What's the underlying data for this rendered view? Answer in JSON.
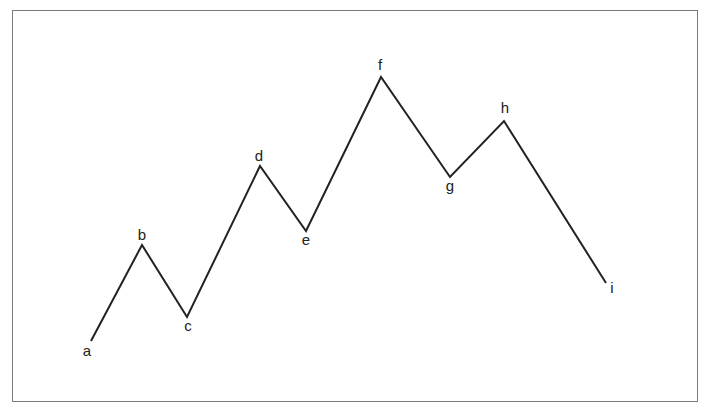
{
  "diagram": {
    "title_partial": "",
    "line_color": "#222222",
    "frame_color": "#7a7a7a",
    "points": [
      {
        "label": "a",
        "x": 91,
        "y": 341,
        "lx": 87,
        "ly": 356
      },
      {
        "label": "b",
        "x": 142,
        "y": 245,
        "lx": 142,
        "ly": 240
      },
      {
        "label": "c",
        "x": 187,
        "y": 317,
        "lx": 188,
        "ly": 331
      },
      {
        "label": "d",
        "x": 260,
        "y": 166,
        "lx": 259,
        "ly": 161
      },
      {
        "label": "e",
        "x": 306,
        "y": 231,
        "lx": 306,
        "ly": 245
      },
      {
        "label": "f",
        "x": 381,
        "y": 77,
        "lx": 380,
        "ly": 70
      },
      {
        "label": "g",
        "x": 450,
        "y": 177,
        "lx": 450,
        "ly": 191
      },
      {
        "label": "h",
        "x": 504,
        "y": 121,
        "lx": 505,
        "ly": 113
      },
      {
        "label": "i",
        "x": 606,
        "y": 283,
        "lx": 612,
        "ly": 293
      }
    ]
  }
}
